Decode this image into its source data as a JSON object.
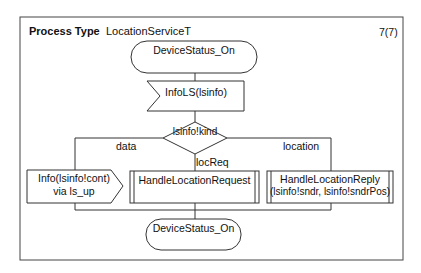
{
  "header": {
    "kind_label": "Process Type",
    "name": "LocationServiceT",
    "page": "7(7)"
  },
  "diagram": {
    "start_state": "DeviceStatus_On",
    "input_signal": "InfoLS(lsinfo)",
    "decision": "lsinfo!kind",
    "branches": {
      "left": "data",
      "middle": "locReq",
      "right": "location"
    },
    "output_signal": {
      "line1": "Info(lsinfo!cont)",
      "line2": "via ls_up"
    },
    "procedure_request": "HandleLocationRequest",
    "procedure_reply": {
      "line1": "HandleLocationReply",
      "line2": "(lsinfo!sndr, lsinfo!sndrPos)"
    },
    "end_state": "DeviceStatus_On"
  },
  "colors": {
    "stroke": "#333333",
    "background": "#ffffff"
  }
}
